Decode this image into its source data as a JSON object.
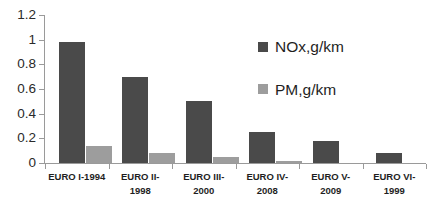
{
  "chart_data": {
    "type": "bar",
    "title": "",
    "subtitle": "",
    "xlabel": "",
    "ylabel": "",
    "ylim": [
      0,
      1.2
    ],
    "grid": false,
    "legend_position": "inside-right",
    "categories": [
      "EURO I-1994",
      "EURO II-1998",
      "EURO III-2000",
      "EURO IV-2008",
      "EURO V-2009",
      "EURO VI-1999"
    ],
    "category_lines": [
      [
        "EURO I-1994"
      ],
      [
        "EURO II-",
        "1998"
      ],
      [
        "EURO III-",
        "2000"
      ],
      [
        "EURO IV-",
        "2008"
      ],
      [
        "EURO V-",
        "2009"
      ],
      [
        "EURO VI-",
        "1999"
      ]
    ],
    "series": [
      {
        "name": "NOx,g/km",
        "color": "#4a4a4a",
        "values": [
          0.98,
          0.7,
          0.5,
          0.25,
          0.18,
          0.08
        ]
      },
      {
        "name": "PM,g/km",
        "color": "#9d9d9d",
        "values": [
          0.14,
          0.08,
          0.05,
          0.02,
          0,
          0
        ]
      }
    ],
    "y_ticks": [
      0,
      0.2,
      0.4,
      0.6,
      0.8,
      1,
      1.2
    ],
    "y_tick_labels": [
      "0",
      "0.2",
      "0.4",
      "0.6",
      "0.8",
      "1",
      "1.2"
    ]
  },
  "legend": {
    "entries": [
      {
        "label": "NOx,g/km",
        "color": "#4a4a4a"
      },
      {
        "label": "PM,g/km",
        "color": "#9d9d9d"
      }
    ]
  },
  "axis": {
    "line_color": "#9a9a9a"
  }
}
